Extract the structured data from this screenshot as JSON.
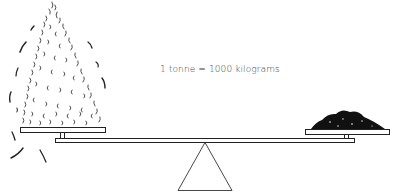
{
  "diagram": {
    "caption": "1 tonne = 1000 kilograms",
    "left_pan": {
      "contents": "feathers",
      "description": "Large pile of feathers on left pan"
    },
    "right_pan": {
      "contents": "coal",
      "description": "Small dark heap on right pan"
    },
    "balance": {
      "type": "seesaw beam balance",
      "state": "level"
    },
    "colors": {
      "ink": "#1a1a1a",
      "background": "#ffffff",
      "text": "#444444"
    }
  }
}
